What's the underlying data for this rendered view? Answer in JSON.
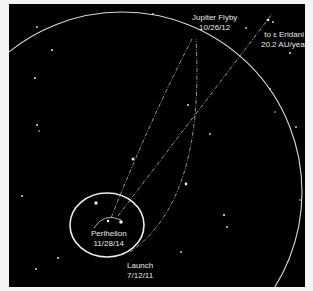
{
  "diagram": {
    "type": "orbital-trajectory",
    "background_color": "#000000",
    "line_color": "#d8d8d8",
    "labels": {
      "jupiter_flyby": {
        "line1": "Jupiter Flyby",
        "line2": "10/26/12"
      },
      "destination": {
        "line1": "to ε Eridani",
        "line2": "20.2 AU/year"
      },
      "perihelion": {
        "line1": "Perihelion",
        "line2": "11/28/14"
      },
      "launch": {
        "line1": "Launch",
        "line2": "7/12/11"
      }
    },
    "objects": {
      "sun": "sun-icon",
      "earth_orbit": "earth-orbit",
      "jupiter_orbit": "jupiter-orbit",
      "trajectory": "spacecraft-trajectory",
      "escape_path": "escape-path"
    }
  }
}
